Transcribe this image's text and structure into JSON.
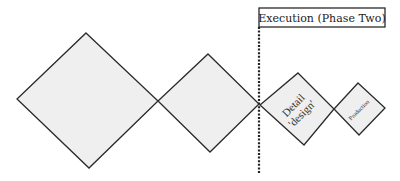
{
  "diagram": {
    "phase_box": {
      "label": "Execution (Phase Two)"
    },
    "stages": [
      {
        "id": "stage-1",
        "label": ""
      },
      {
        "id": "stage-2",
        "label": ""
      },
      {
        "id": "stage-3",
        "label_line1": "Detail",
        "label_line2": "'design'"
      },
      {
        "id": "stage-4",
        "label": "Production"
      }
    ],
    "colors": {
      "diamond_fill": "#efefef",
      "stroke": "#2a2a2a",
      "background": "#ffffff"
    }
  }
}
